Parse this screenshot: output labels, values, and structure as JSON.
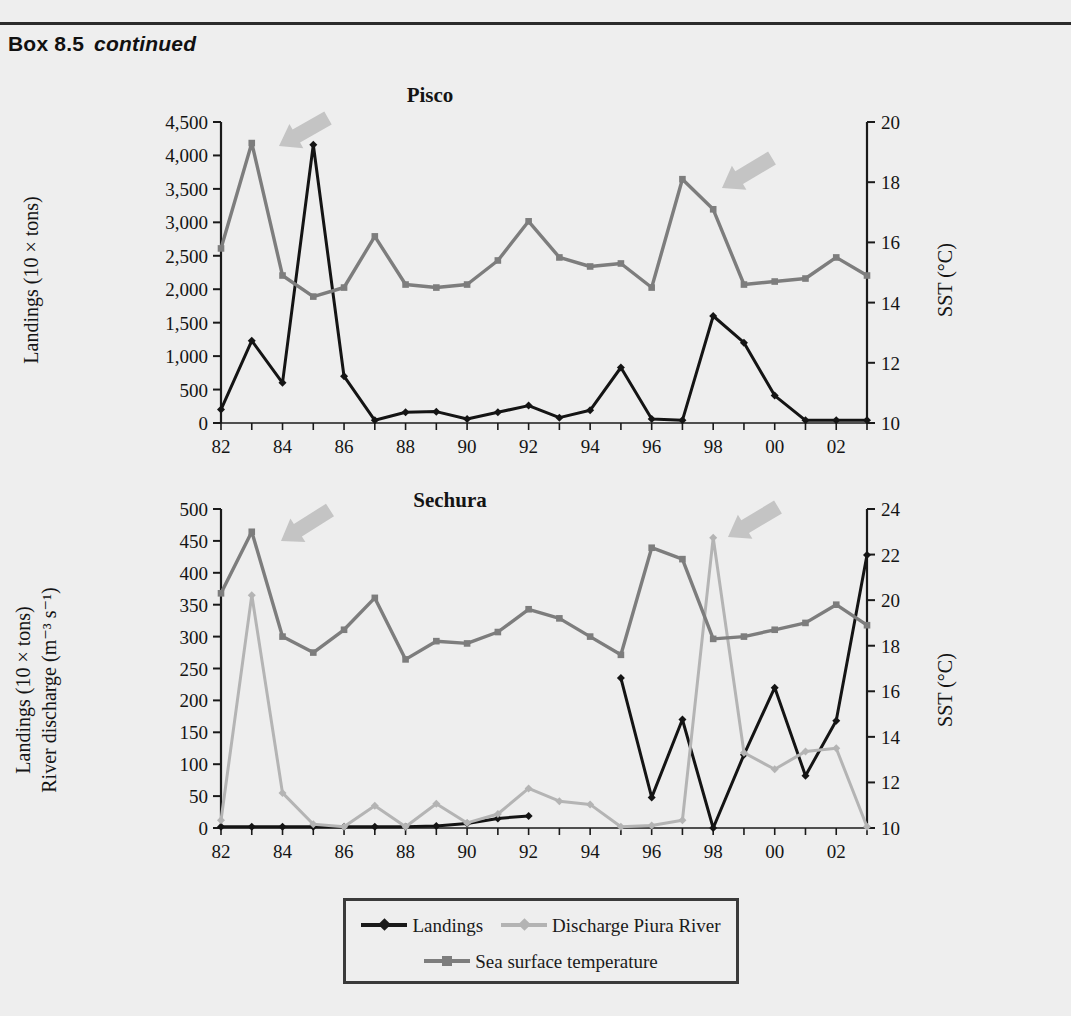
{
  "header": {
    "box_label": "Box 8.5",
    "continued": "continued"
  },
  "legend": {
    "items": [
      {
        "label": "Landings",
        "color": "#1a1a1a",
        "marker": "diamond"
      },
      {
        "label": "Discharge Piura River",
        "color": "#b3b3b3",
        "marker": "diamond"
      },
      {
        "label": "Sea surface temperature",
        "color": "#7d7d7d",
        "marker": "square"
      }
    ]
  },
  "colors": {
    "landings": "#141414",
    "discharge": "#b4b4b4",
    "sst": "#7d7d7d",
    "arrow": "#c4c4c4",
    "axis": "#1a1a1a",
    "background": "#eeeeee"
  },
  "chart_data": [
    {
      "id": "pisco",
      "type": "line",
      "title": "Pisco",
      "xlabel": "",
      "ylabel": "Landings (10 × tons)",
      "y2label": "SST (°C)",
      "x": [
        82,
        83,
        84,
        85,
        86,
        87,
        88,
        89,
        90,
        91,
        92,
        93,
        94,
        95,
        96,
        97,
        98,
        99,
        "00",
        "01",
        "02",
        "03"
      ],
      "xtick_labels": [
        "82",
        "84",
        "86",
        "88",
        "90",
        "92",
        "94",
        "96",
        "98",
        "00",
        "02"
      ],
      "xlim": [
        82,
        103
      ],
      "ylim": [
        0,
        4500
      ],
      "ytick_labels": [
        "0",
        "500",
        "1,000",
        "1,500",
        "2,000",
        "2,500",
        "3,000",
        "3,500",
        "4,000",
        "4,500"
      ],
      "y2lim": [
        10,
        20
      ],
      "y2tick_labels": [
        "10",
        "12",
        "14",
        "16",
        "18",
        "20"
      ],
      "grid": false,
      "legend_position": "below-figure",
      "series": [
        {
          "name": "Landings",
          "axis": "left",
          "color": "#141414",
          "values": [
            200,
            1230,
            600,
            4160,
            700,
            40,
            160,
            170,
            60,
            160,
            260,
            80,
            190,
            830,
            60,
            40,
            1600,
            1200,
            410,
            40,
            40,
            40
          ]
        },
        {
          "name": "Sea surface temperature",
          "axis": "right",
          "color": "#7d7d7d",
          "values": [
            15.8,
            19.3,
            14.9,
            14.2,
            14.5,
            16.2,
            14.6,
            14.5,
            14.6,
            15.4,
            16.7,
            15.5,
            15.2,
            15.3,
            14.5,
            18.1,
            17.1,
            14.6,
            14.7,
            14.8,
            15.5,
            14.9
          ]
        }
      ],
      "annotations": [
        {
          "type": "arrow",
          "points_to": "1983 SST peak",
          "direction": "down-left"
        },
        {
          "type": "arrow",
          "points_to": "1997 SST peak",
          "direction": "down-left"
        }
      ]
    },
    {
      "id": "sechura",
      "type": "line",
      "title": "Sechura",
      "xlabel": "",
      "ylabel": "Landings (10 × tons)\nRiver discharge (m⁻³ s⁻¹)",
      "ylabel_line1": "Landings (10 × tons)",
      "ylabel_line2": "River discharge (m⁻³ s⁻¹)",
      "y2label": "SST (°C)",
      "x": [
        82,
        83,
        84,
        85,
        86,
        87,
        88,
        89,
        90,
        91,
        92,
        93,
        94,
        95,
        96,
        97,
        98,
        99,
        "00",
        "01",
        "02",
        "03"
      ],
      "xtick_labels": [
        "82",
        "84",
        "86",
        "88",
        "90",
        "92",
        "94",
        "96",
        "98",
        "00",
        "02"
      ],
      "xlim": [
        82,
        103
      ],
      "ylim": [
        0,
        500
      ],
      "ytick_labels": [
        "0",
        "50",
        "100",
        "150",
        "200",
        "250",
        "300",
        "350",
        "400",
        "450",
        "500"
      ],
      "y2lim": [
        10,
        24
      ],
      "y2tick_labels": [
        "10",
        "12",
        "14",
        "16",
        "18",
        "20",
        "22",
        "24"
      ],
      "grid": false,
      "legend_position": "below-figure",
      "series": [
        {
          "name": "Landings",
          "axis": "left",
          "color": "#141414",
          "values": [
            2,
            2,
            2,
            2,
            2,
            2,
            2,
            3,
            7,
            15,
            19,
            null,
            null,
            235,
            48,
            170,
            0,
            115,
            220,
            82,
            168,
            428
          ]
        },
        {
          "name": "Discharge Piura River",
          "axis": "left",
          "color": "#b4b4b4",
          "values": [
            12,
            365,
            55,
            6,
            2,
            35,
            2,
            38,
            8,
            22,
            62,
            42,
            37,
            2,
            4,
            12,
            455,
            118,
            92,
            120,
            125,
            2
          ]
        },
        {
          "name": "Sea surface temperature",
          "axis": "right",
          "color": "#7d7d7d",
          "values": [
            20.3,
            23.0,
            18.4,
            17.7,
            18.7,
            20.1,
            17.4,
            18.2,
            18.1,
            18.6,
            19.6,
            19.2,
            18.4,
            17.6,
            22.3,
            21.8,
            18.3,
            18.4,
            18.7,
            19.0,
            19.8,
            18.9
          ]
        }
      ],
      "annotations": [
        {
          "type": "arrow",
          "points_to": "1983 SST peak",
          "direction": "down-left"
        },
        {
          "type": "arrow",
          "points_to": "1997/98 peak",
          "direction": "down-left"
        }
      ]
    }
  ]
}
